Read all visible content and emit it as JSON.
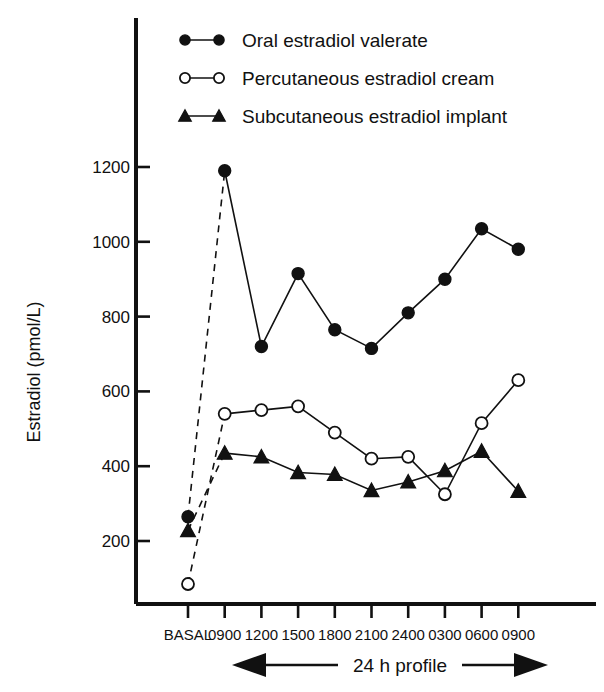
{
  "figure": {
    "background": "#ffffff",
    "ink_color": "#111111"
  },
  "legend": {
    "position": "top-left-inside",
    "entries": [
      {
        "label": "Oral estradiol valerate",
        "marker": "filled-circle",
        "line": "solid",
        "color": "#111111"
      },
      {
        "label": "Percutaneous estradiol cream",
        "marker": "open-circle",
        "line": "solid",
        "color": "#111111"
      },
      {
        "label": "Subcutaneous estradiol implant",
        "marker": "filled-triangle",
        "line": "solid",
        "color": "#111111"
      }
    ]
  },
  "annotations": {
    "profile_span": "24 h profile",
    "left_arrow": "left-arrow-icon",
    "right_arrow": "right-arrow-icon"
  },
  "chart_data": {
    "type": "line",
    "title": "",
    "xlabel": "",
    "ylabel": "Estradiol (pmol/L)",
    "categories": [
      "BASAL",
      "0900",
      "1200",
      "1500",
      "1800",
      "2100",
      "2400",
      "0300",
      "0600",
      "0900"
    ],
    "ylim": [
      0,
      1300
    ],
    "yticks": [
      200,
      400,
      600,
      800,
      1000,
      1200
    ],
    "ytick_labels": [
      "200",
      "400",
      "600",
      "800",
      "1000",
      "1200"
    ],
    "grid": false,
    "legend_position": "top-left-inside",
    "basal_connector": "dashed",
    "series": [
      {
        "name": "Oral estradiol valerate",
        "marker": "filled-circle",
        "values": [
          265,
          1190,
          720,
          915,
          765,
          715,
          810,
          900,
          1035,
          980
        ]
      },
      {
        "name": "Percutaneous estradiol cream",
        "marker": "open-circle",
        "values": [
          85,
          540,
          550,
          560,
          490,
          420,
          425,
          325,
          515,
          630
        ]
      },
      {
        "name": "Subcutaneous estradiol implant",
        "marker": "filled-triangle",
        "values": [
          228,
          435,
          425,
          383,
          378,
          335,
          358,
          388,
          440,
          333
        ]
      }
    ]
  }
}
